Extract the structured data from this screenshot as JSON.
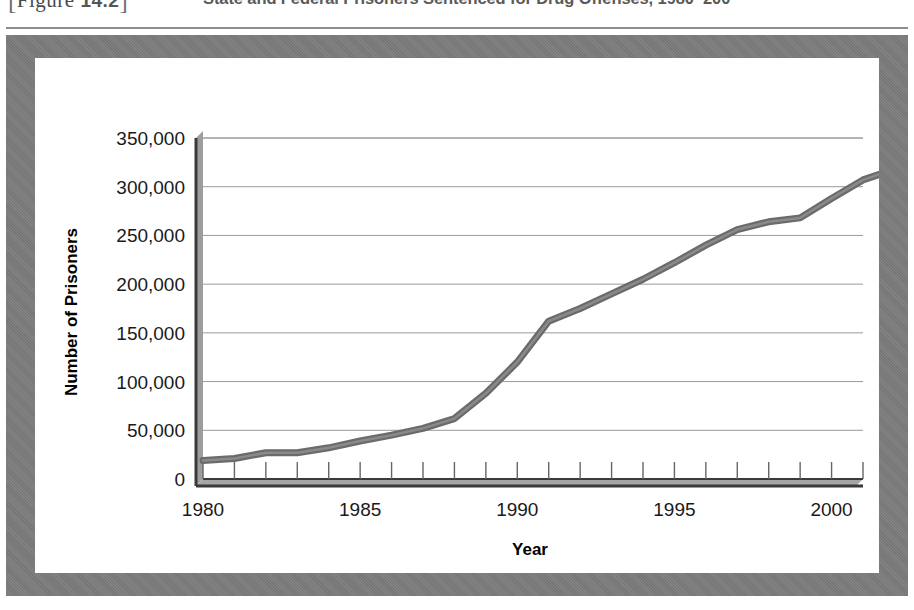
{
  "figure": {
    "tag_open": "[",
    "tag_label": "Figure",
    "tag_number": "14.2",
    "tag_close": "]",
    "title": "State and Federal Prisoners Sentenced for Drug Offenses, 1980–200"
  },
  "colors": {
    "frame": "#7c7c7c",
    "plot_background": "#ffffff",
    "line": "#6b6b6b",
    "axis": "#333333",
    "gridline": "#9a9a9a",
    "text": "#1a1a1a"
  },
  "chart_data": {
    "type": "line",
    "title": "State and Federal Prisoners Sentenced for Drug Offenses, 1980–200",
    "xlabel": "Year",
    "ylabel": "Number of Prisoners",
    "xlim": [
      1980,
      2001
    ],
    "ylim": [
      0,
      350000
    ],
    "grid": true,
    "legend": "none",
    "ytick_labels": [
      "350,000",
      "300,000",
      "250,000",
      "200,000",
      "150,000",
      "100,000",
      "50,000",
      "0"
    ],
    "ytick_values": [
      350000,
      300000,
      250000,
      200000,
      150000,
      100000,
      50000,
      0
    ],
    "xtick_labels": [
      "1980",
      "1985",
      "1990",
      "1995",
      "2000"
    ],
    "xtick_values": [
      1980,
      1985,
      1990,
      1995,
      2000
    ],
    "x_minor_ticks_every": 1,
    "series": [
      {
        "name": "State and Federal Prisoners Sentenced for Drug Offenses",
        "x": [
          1980,
          1981,
          1982,
          1983,
          1984,
          1985,
          1986,
          1987,
          1988,
          1989,
          1990,
          1991,
          1992,
          1993,
          1994,
          1995,
          1996,
          1997,
          1998,
          1999,
          2000,
          2001
        ],
        "values": [
          19000,
          21000,
          27000,
          27000,
          32000,
          39000,
          45000,
          52000,
          62000,
          88000,
          120000,
          162000,
          175000,
          190000,
          205000,
          222000,
          240000,
          256000,
          264000,
          268000,
          288000,
          307000
        ]
      }
    ],
    "note": "Line rises steeply from about 19,000 prisoners in 1980 to roughly 318,000 by 2001."
  },
  "line_points": "19000,21000,27000,27000,32000,39000,45000,52000,62000,88000,120000,162000,175000,190000,205000,222000,240000,256000,264000,268000,288000,307000,318000"
}
